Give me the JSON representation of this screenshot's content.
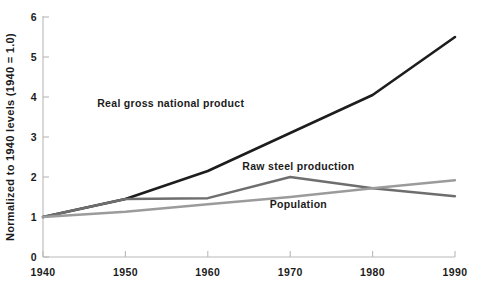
{
  "chart_data": {
    "type": "line",
    "title": "",
    "xlabel": "",
    "ylabel": "Normalized to 1940 levels (1940 = 1.0)",
    "x": [
      1940,
      1950,
      1960,
      1970,
      1980,
      1990
    ],
    "xtick_labels": [
      "1940",
      "1950",
      "1960",
      "1970",
      "1980",
      "1990"
    ],
    "ytick_labels": [
      "0",
      "1",
      "2",
      "3",
      "4",
      "5",
      "6"
    ],
    "yticks": [
      0,
      1,
      2,
      3,
      4,
      5,
      6
    ],
    "xlim": [
      1940,
      1990
    ],
    "ylim": [
      0,
      6
    ],
    "grid": false,
    "legend_position": "inline-annotations",
    "series": [
      {
        "name": "Real gross national product",
        "color": "#1d1d1d",
        "width": 2.6,
        "values": [
          1.0,
          1.45,
          2.15,
          3.1,
          4.05,
          5.5
        ],
        "label_x": 1955.5,
        "label_y": 3.75,
        "label_anchor": "middle"
      },
      {
        "name": "Raw steel production",
        "color": "#6e6e6e",
        "width": 2.4,
        "values": [
          1.0,
          1.45,
          1.47,
          2.0,
          1.72,
          1.52
        ],
        "label_x": 1971.0,
        "label_y": 2.18,
        "label_anchor": "middle"
      },
      {
        "name": "Population",
        "color": "#9b9b9b",
        "width": 2.4,
        "values": [
          1.0,
          1.13,
          1.32,
          1.5,
          1.72,
          1.92
        ],
        "label_x": 1971.0,
        "label_y": 1.22,
        "label_anchor": "middle"
      }
    ]
  }
}
